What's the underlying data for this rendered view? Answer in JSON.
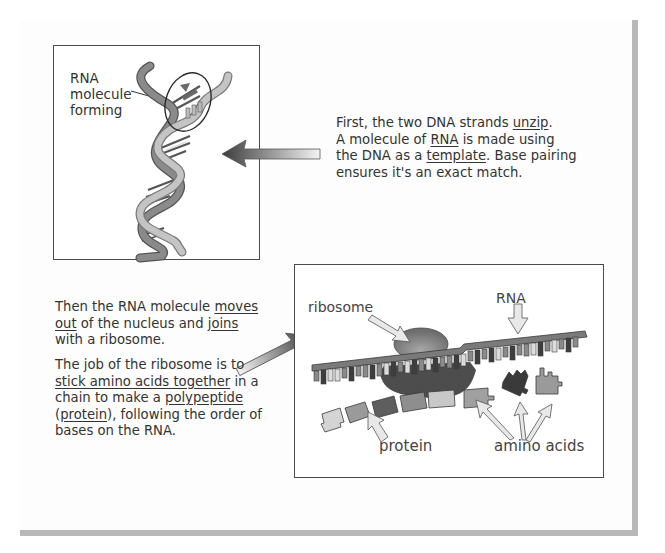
{
  "figure": {
    "panel1": {
      "label_lines": [
        "RNA",
        "molecule",
        "forming"
      ],
      "caption_parts": [
        {
          "t": "First, the two DNA strands ",
          "u": false
        },
        {
          "t": "unzip",
          "u": true
        },
        {
          "t": ".",
          "u": false
        },
        {
          "t": "A molecule of ",
          "u": false,
          "br_before": true
        },
        {
          "t": "RNA",
          "u": true
        },
        {
          "t": " is made using",
          "u": false
        },
        {
          "t": "the DNA as a ",
          "u": false,
          "br_before": true
        },
        {
          "t": "template",
          "u": true
        },
        {
          "t": ".  Base pairing",
          "u": false
        },
        {
          "t": "ensures it's an exact match.",
          "u": false,
          "br_before": true
        }
      ]
    },
    "panel2": {
      "labels": {
        "ribosome": "ribosome",
        "rna": "RNA",
        "protein": "protein",
        "amino_acids": "amino acids"
      },
      "caption1_parts": [
        {
          "t": "Then the RNA molecule ",
          "u": false
        },
        {
          "t": "moves",
          "u": true
        },
        {
          "t": "out",
          "u": true,
          "br_before": true
        },
        {
          "t": " of the nucleus and ",
          "u": false
        },
        {
          "t": "joins",
          "u": true
        },
        {
          "t": "with a ribosome.",
          "u": false,
          "br_before": true
        }
      ],
      "caption2_parts": [
        {
          "t": "The job of the ribosome is to",
          "u": false
        },
        {
          "t": "stick amino acids together",
          "u": true,
          "br_before": true
        },
        {
          "t": " in a",
          "u": false
        },
        {
          "t": "chain to make a ",
          "u": false,
          "br_before": true
        },
        {
          "t": "polypeptide",
          "u": true
        },
        {
          "t": "(",
          "u": false,
          "br_before": true
        },
        {
          "t": "protein",
          "u": true
        },
        {
          "t": "), following the order of",
          "u": false
        },
        {
          "t": "bases on the RNA.",
          "u": false,
          "br_before": true
        }
      ]
    },
    "colors": {
      "frame": "#4a4a4a",
      "strand_dark": "#7a7a7a",
      "strand_light": "#b4b4b4",
      "arrow_dark": "#3c3c3c",
      "arrow_light": "#f0f0f0",
      "shadow": "#b8b8b8"
    }
  }
}
